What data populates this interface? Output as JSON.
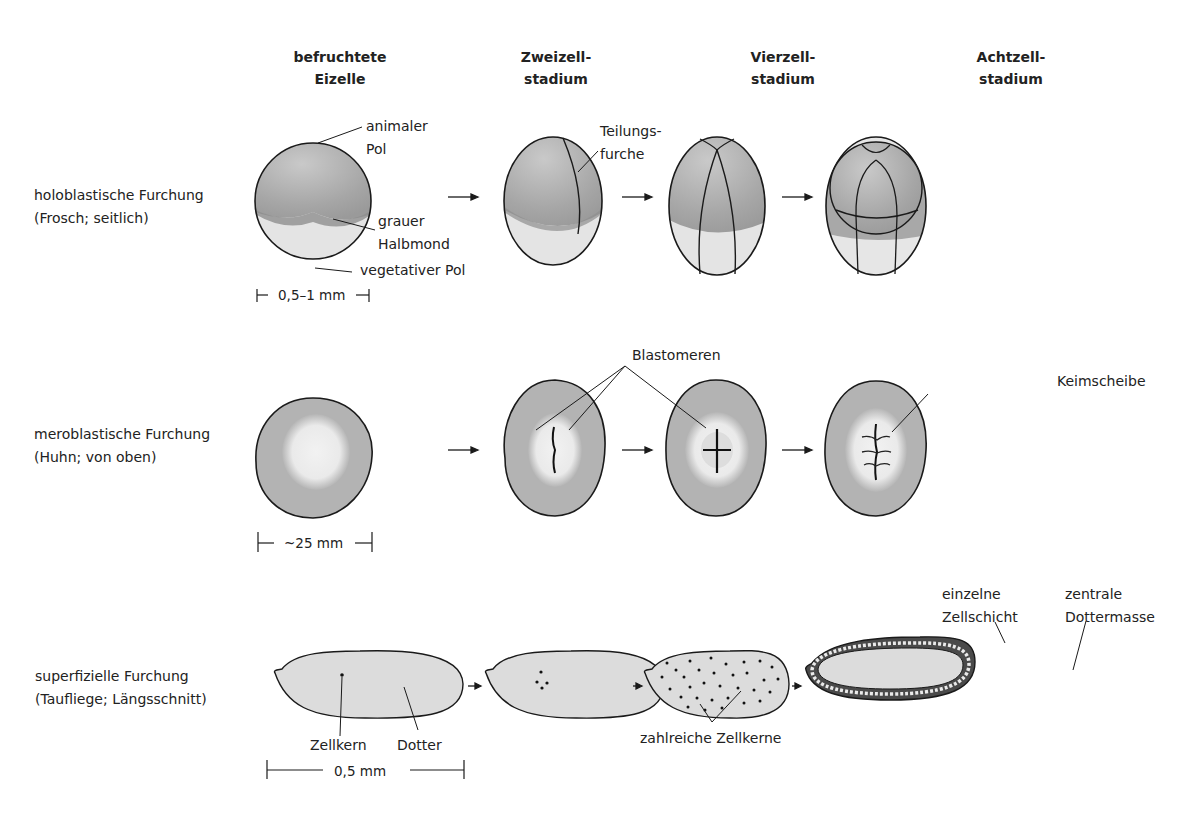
{
  "columns": [
    {
      "line1": "befruchtete",
      "line2": "Eizelle"
    },
    {
      "line1": "Zweizell-",
      "line2": "stadium"
    },
    {
      "line1": "Vierzell-",
      "line2": "stadium"
    },
    {
      "line1": "Achtzell-",
      "line2": "stadium"
    }
  ],
  "rows": [
    {
      "line1": "holoblastische Furchung",
      "line2": "(Frosch; seitlich)",
      "labels": {
        "animal_pole_1": "animaler",
        "animal_pole_2": "Pol",
        "gray_crescent_1": "grauer",
        "gray_crescent_2": "Halbmond",
        "vegetal_pole": "vegetativer Pol",
        "cleavage_furrow_1": "Teilungs-",
        "cleavage_furrow_2": "furche"
      },
      "scale": "0,5–1 mm"
    },
    {
      "line1": "meroblastische Furchung",
      "line2": "(Huhn; von oben)",
      "labels": {
        "blastomeres": "Blastomeren",
        "germinal_disc": "Keimscheibe"
      },
      "scale": "~25 mm"
    },
    {
      "line1": "superfizielle Furchung",
      "line2": "(Taufliege; Längsschnitt)",
      "labels": {
        "nucleus": "Zellkern",
        "yolk": "Dotter",
        "many_nuclei": "zahlreiche Zellkerne",
        "single_layer_1": "einzelne",
        "single_layer_2": "Zellschicht",
        "central_yolk_1": "zentrale",
        "central_yolk_2": "Dottermasse"
      },
      "scale": "0,5 mm"
    }
  ],
  "colors": {
    "animal_hemisphere": "#a9a9a9",
    "vegetal_hemisphere": "#e6e6e6",
    "yolk_disc": "#b3b3b3",
    "blastodisc": "#ececec",
    "fly_egg": "#dcdcdc",
    "outline": "#1a1a1a"
  }
}
